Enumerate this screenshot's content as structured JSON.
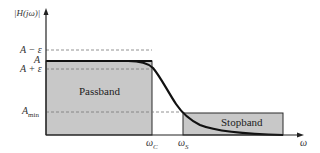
{
  "diagram": {
    "y_axis_label": "|H(jω)|",
    "x_axis_label": "ω",
    "y_levels": [
      {
        "id": "a_minus_eps",
        "label": "A − ε"
      },
      {
        "id": "a",
        "label": "A"
      },
      {
        "id": "a_plus_eps",
        "label": "A + ε"
      },
      {
        "id": "a_min",
        "label": "A",
        "subscript": "min"
      }
    ],
    "x_marks": [
      {
        "id": "omega_c",
        "label": "ω",
        "subscript": "C"
      },
      {
        "id": "omega_s",
        "label": "ω",
        "subscript": "S"
      }
    ],
    "regions": {
      "passband": "Passband",
      "stopband": "Stopband"
    },
    "colors": {
      "region_fill": "#c8c8c8",
      "outline": "#2a2a2a",
      "curve": "#111111",
      "dashed": "#777777"
    }
  }
}
